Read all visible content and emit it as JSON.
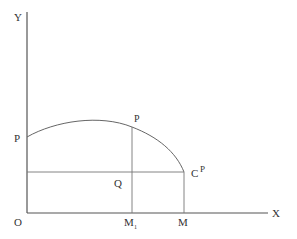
{
  "diagram": {
    "axes": {
      "x_label": "X",
      "y_label": "Y",
      "origin_label": "O"
    },
    "points": {
      "p_y_intercept": "P",
      "p_on_curve": "P",
      "q": "Q",
      "c": "C",
      "c_superscript": "P",
      "m1": "M",
      "m1_subscript": "1",
      "m": "M"
    },
    "colors": {
      "axis": "#555555",
      "lines": "#777777",
      "text": "#333333",
      "background": "#ffffff"
    }
  }
}
